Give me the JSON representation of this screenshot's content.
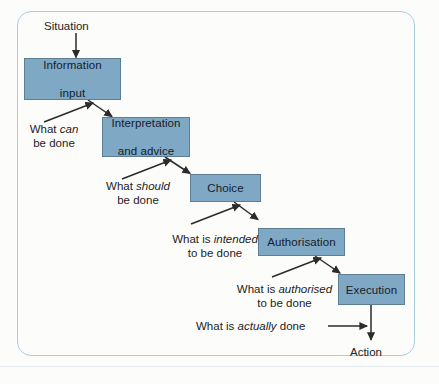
{
  "diagram": {
    "colors": {
      "node_fill": "#7fa8c4",
      "node_border": "#5d7f96",
      "frame_border": "#a8cddf",
      "text": "#1d1d1d",
      "arrow": "#2b2b2b"
    },
    "start_label": "Situation",
    "end_label": "Action",
    "nodes": [
      {
        "id": "information-input",
        "line1": "Information",
        "line2": "input"
      },
      {
        "id": "interpretation-and-advice",
        "line1": "Interpretation",
        "line2": "and advice"
      },
      {
        "id": "choice",
        "line1": "Choice",
        "line2": ""
      },
      {
        "id": "authorisation",
        "line1": "Authorisation",
        "line2": ""
      },
      {
        "id": "execution",
        "line1": "Execution",
        "line2": ""
      }
    ],
    "annotations": [
      {
        "id": "what-can-be-done",
        "lead": "What ",
        "emphasis": "can",
        "tail": "",
        "line2": "be done"
      },
      {
        "id": "what-should-be-done",
        "lead": "What ",
        "emphasis": "should",
        "tail": "",
        "line2": "be done"
      },
      {
        "id": "what-is-intended-to-be-done",
        "lead": "What is ",
        "emphasis": "intended",
        "tail": "",
        "line2": "to be done"
      },
      {
        "id": "what-is-authorised-to-be-done",
        "lead": "What is ",
        "emphasis": "authorised",
        "tail": "",
        "line2": "to be done"
      },
      {
        "id": "what-is-actually-done",
        "lead": "What is ",
        "emphasis": "actually",
        "tail": " done",
        "line2": ""
      }
    ]
  }
}
